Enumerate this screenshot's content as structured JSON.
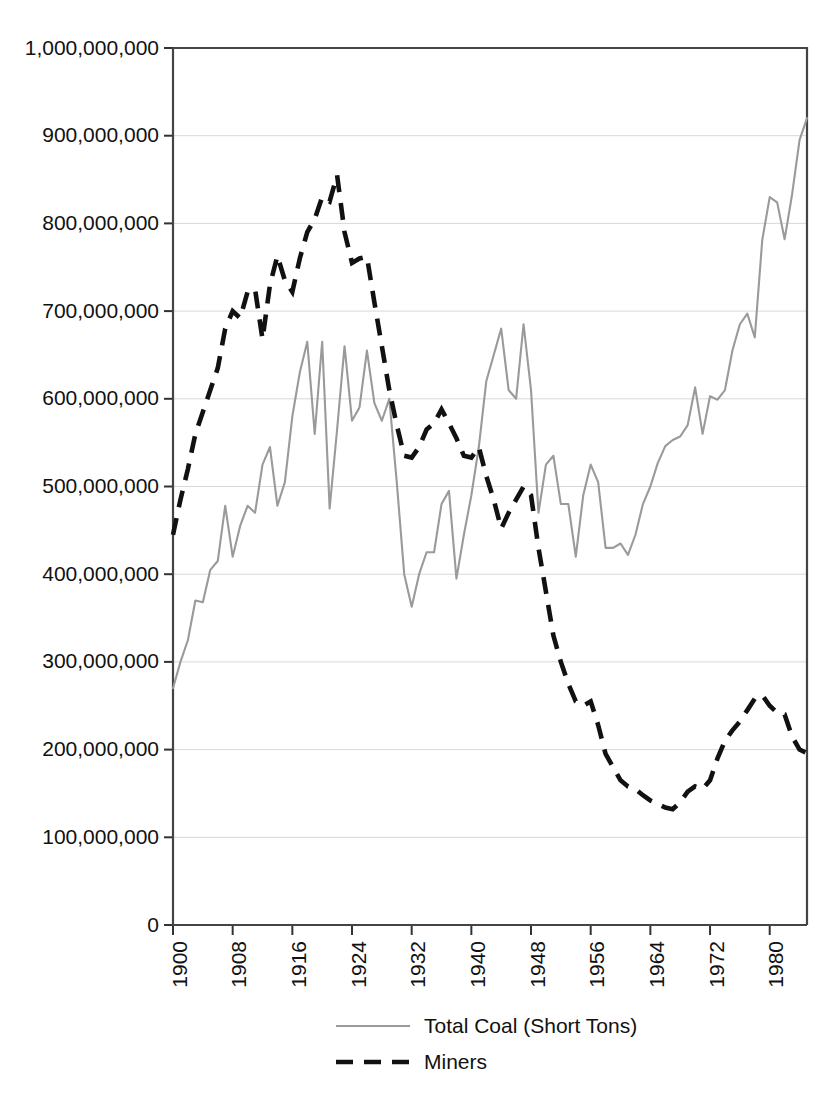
{
  "figure": {
    "title": "",
    "background_color": "#ffffff",
    "width": 837,
    "height": 1098
  },
  "axes": {
    "plot_left": 173,
    "plot_right": 807,
    "plot_top": 48,
    "plot_bottom": 925,
    "y_tick_labels": [
      "1,000,000,000",
      "900,000,000",
      "800,000,000",
      "700,000,000",
      "600,000,000",
      "500,000,000",
      "400,000,000",
      "300,000,000",
      "200,000,000",
      "100,000,000",
      "0"
    ],
    "x_tick_labels": [
      "1900",
      "1908",
      "1916",
      "1924",
      "1932",
      "1940",
      "1948",
      "1956",
      "1964",
      "1972",
      "1980"
    ]
  },
  "legend": {
    "position": "bottom-center",
    "entries": [
      {
        "label": "Total Coal (Short Tons)",
        "style": "solid",
        "color": "#9a9a9a"
      },
      {
        "label": "Miners",
        "style": "dashed",
        "color": "#111111"
      }
    ]
  },
  "chart_data": {
    "type": "line",
    "title": "",
    "xlabel": "",
    "ylabel": "",
    "xlim": [
      1900,
      1985
    ],
    "ylim": [
      0,
      1000000000
    ],
    "grid": true,
    "legend_position": "bottom-center",
    "x_tick_step": 8,
    "y_tick_step": 100000000,
    "x": [
      1900,
      1901,
      1902,
      1903,
      1904,
      1905,
      1906,
      1907,
      1908,
      1909,
      1910,
      1911,
      1912,
      1913,
      1914,
      1915,
      1916,
      1917,
      1918,
      1919,
      1920,
      1921,
      1922,
      1923,
      1924,
      1925,
      1926,
      1927,
      1928,
      1929,
      1930,
      1931,
      1932,
      1933,
      1934,
      1935,
      1936,
      1937,
      1938,
      1939,
      1940,
      1941,
      1942,
      1943,
      1944,
      1945,
      1946,
      1947,
      1948,
      1949,
      1950,
      1951,
      1952,
      1953,
      1954,
      1955,
      1956,
      1957,
      1958,
      1959,
      1960,
      1961,
      1962,
      1963,
      1964,
      1965,
      1966,
      1967,
      1968,
      1969,
      1970,
      1971,
      1972,
      1973,
      1974,
      1975,
      1976,
      1977,
      1978,
      1979,
      1980,
      1981,
      1982,
      1983,
      1984,
      1985
    ],
    "series": [
      {
        "name": "Total Coal (Short Tons)",
        "style": "solid",
        "color": "#9a9a9a",
        "values": [
          270000000,
          300000000,
          325000000,
          370000000,
          368000000,
          405000000,
          415000000,
          478000000,
          420000000,
          455000000,
          478000000,
          470000000,
          525000000,
          545000000,
          478000000,
          505000000,
          580000000,
          630000000,
          665000000,
          560000000,
          665000000,
          475000000,
          565000000,
          660000000,
          575000000,
          590000000,
          655000000,
          595000000,
          575000000,
          600000000,
          505000000,
          400000000,
          363000000,
          400000000,
          425000000,
          425000000,
          480000000,
          495000000,
          395000000,
          445000000,
          490000000,
          545000000,
          620000000,
          650000000,
          680000000,
          610000000,
          600000000,
          685000000,
          610000000,
          470000000,
          525000000,
          535000000,
          480000000,
          480000000,
          420000000,
          490000000,
          525000000,
          505000000,
          430000000,
          430000000,
          435000000,
          422000000,
          445000000,
          480000000,
          500000000,
          527000000,
          546000000,
          553000000,
          557000000,
          570000000,
          613000000,
          560000000,
          603000000,
          599000000,
          610000000,
          655000000,
          685000000,
          697000000,
          670000000,
          781000000,
          830000000,
          824000000,
          782000000,
          833000000,
          895000000,
          920000000
        ]
      },
      {
        "name": "Miners",
        "style": "dashed",
        "color": "#111111",
        "values": [
          445000000,
          485000000,
          520000000,
          560000000,
          585000000,
          610000000,
          635000000,
          680000000,
          700000000,
          692000000,
          722000000,
          725000000,
          668000000,
          730000000,
          763000000,
          735000000,
          722000000,
          760000000,
          790000000,
          805000000,
          830000000,
          825000000,
          855000000,
          790000000,
          755000000,
          760000000,
          762000000,
          710000000,
          660000000,
          610000000,
          570000000,
          535000000,
          533000000,
          545000000,
          565000000,
          572000000,
          588000000,
          572000000,
          555000000,
          535000000,
          533000000,
          545000000,
          512000000,
          485000000,
          452000000,
          470000000,
          485000000,
          500000000,
          490000000,
          430000000,
          380000000,
          330000000,
          300000000,
          275000000,
          255000000,
          250000000,
          255000000,
          228000000,
          195000000,
          180000000,
          165000000,
          158000000,
          155000000,
          148000000,
          142000000,
          138000000,
          134000000,
          132000000,
          140000000,
          152000000,
          158000000,
          155000000,
          165000000,
          190000000,
          210000000,
          222000000,
          232000000,
          245000000,
          258000000,
          262000000,
          250000000,
          242000000,
          240000000,
          215000000,
          200000000,
          196000000
        ]
      }
    ]
  }
}
